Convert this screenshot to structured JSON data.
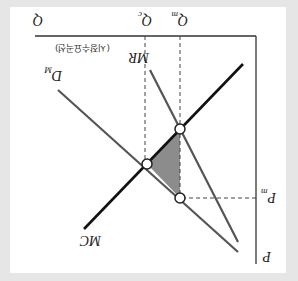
{
  "diagram": {
    "orientation": "rotated-180",
    "title": "",
    "colors": {
      "background": "#e6e6e6",
      "panel": "#ffffff",
      "mc_line": "#111111",
      "demand_line": "#555555",
      "mr_line": "#555555",
      "deadweight_fill": "#8c8c8c",
      "axis": "#333333"
    },
    "axes": {
      "y_label": "P",
      "x_label": "Q"
    },
    "ticks": {
      "pm": {
        "main": "P",
        "sub": "m"
      },
      "qc": {
        "main": "Q",
        "sub": "c"
      },
      "qm": {
        "main": "Q",
        "sub": "m"
      }
    },
    "curves": {
      "mc": {
        "label": "MC"
      },
      "mr": {
        "label": "MR"
      },
      "demand": {
        "main": "D",
        "sub": "M",
        "note": "(시장수요곡선)"
      }
    },
    "points": [
      {
        "name": "competitive-equilibrium",
        "desc": "MC ∩ D at Qc"
      },
      {
        "name": "monopoly-mc-mr",
        "desc": "MC ∩ MR at Qm"
      },
      {
        "name": "monopoly-price",
        "desc": "Pm on D at Qm"
      }
    ],
    "shaded_region": "deadweight-loss"
  }
}
